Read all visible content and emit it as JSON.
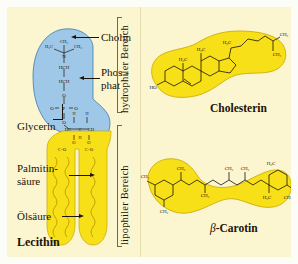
{
  "figure": {
    "language": "de",
    "topic": "Membranlipide",
    "background_color": "#fbf6cf",
    "hydrophilic_color": "#9fc7e8",
    "lipophilic_color": "#f7e017"
  },
  "lecithin": {
    "name": "Lecithin",
    "callouts": [
      {
        "id": "cholin",
        "label": "Cholin"
      },
      {
        "id": "phosphat",
        "label": "Phos -",
        "label2": "phat"
      },
      {
        "id": "glycerin",
        "label": "Glycerin"
      },
      {
        "id": "palmitin",
        "label": "Palmitin-",
        "label2": "säure"
      },
      {
        "id": "oel",
        "label": "Ölsäure"
      }
    ],
    "atoms": {
      "ch3_top": "CH₃",
      "h3c_left": "H₃C",
      "ch3_right": "CH₃",
      "n": "N",
      "hch_1": "HCH",
      "hch_2": "HCH",
      "o_1": "O",
      "o_left": "O",
      "p": "P",
      "o_right": "O",
      "o_2": "O",
      "h_a": "H",
      "h_b": "H",
      "hc": "HC",
      "c": "C",
      "ch": "CH",
      "h_c": "H",
      "o_3": "O",
      "o_4": "O",
      "o_5": "O",
      "co_1": "C=O",
      "co_2": "C=O"
    }
  },
  "regions": {
    "hydrophilic": "hydrophiler Bereich",
    "lipophilic": "lipophiler Bereich"
  },
  "cholesterin": {
    "name": "Cholesterin",
    "atoms": {
      "ho": "HO",
      "h3c_ring": "H₃C",
      "h3c_mid": "H₃C",
      "h3c_side": "H₃C",
      "ch3_a": "CH₃",
      "ch3_b": "CH₃"
    }
  },
  "carotin": {
    "name_italic": "β",
    "name_rest": "-Carotin",
    "atoms": {
      "ch3_1": "CH₃",
      "ch3_2": "CH₃",
      "ch3_3": "CH₃",
      "ch3_4": "CH₃",
      "ch3_5": "CH₃",
      "ch3_6": "CH₃",
      "h3c_a": "H₃C",
      "h3c_b": "H₃C",
      "ch3_c": "CH₃"
    }
  }
}
